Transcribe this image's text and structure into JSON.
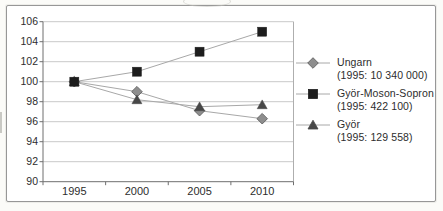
{
  "chart_data": {
    "type": "line",
    "title": "",
    "categories": [
      "1995",
      "2000",
      "2005",
      "2010"
    ],
    "series": [
      {
        "name": "Ungarn",
        "note": "(1995: 10 340 000)",
        "marker": "diamond",
        "fill": "#8e8e8e",
        "stroke": "#565656",
        "values": [
          100,
          99,
          97.1,
          96.3
        ]
      },
      {
        "name": "Györ-Moson-Sopron",
        "note": "(1995: 422 100)",
        "marker": "square",
        "fill": "#1d1d1d",
        "stroke": "#1d1d1d",
        "values": [
          100,
          101,
          103,
          105
        ]
      },
      {
        "name": "Györ",
        "note": "(1995: 129 558)",
        "marker": "triangle",
        "fill": "#474747",
        "stroke": "#474747",
        "values": [
          100,
          98.2,
          97.5,
          97.7
        ]
      }
    ],
    "ylim": [
      90,
      106
    ],
    "ytick_step": 2,
    "yticks": [
      "106",
      "104",
      "102",
      "100",
      "98",
      "96",
      "94",
      "92",
      "90"
    ],
    "xlabel": "",
    "ylabel": "",
    "grid": true,
    "legend_position": "right",
    "colors": {
      "grid": "#c9c9c9",
      "axis": "#6f6f6f",
      "plot_border": "#aeaeae",
      "line": "#a8a8a8",
      "text": "#2d2d2d"
    }
  }
}
